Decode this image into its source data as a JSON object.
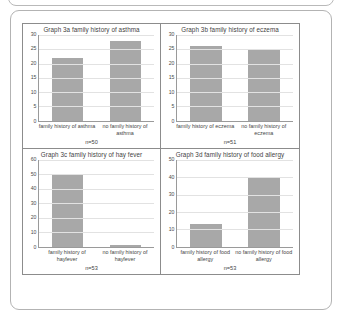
{
  "figure": {
    "panels": [
      {
        "title": "Graph 3a family history of asthma",
        "n_caption": "n=50",
        "chart_data": {
          "type": "bar",
          "title": "Graph 3a family history of asthma",
          "categories": [
            "family history of asthma",
            "no family history of asthma"
          ],
          "values": [
            22,
            28
          ],
          "xlabel": "",
          "ylabel": "",
          "ylim": [
            0,
            30
          ],
          "yticks": [
            0,
            5,
            10,
            15,
            20,
            25,
            30
          ],
          "grid": true,
          "legend": "none",
          "bar_color": "#a8a8a8",
          "annotation": "n=50"
        }
      },
      {
        "title": "Graph 3b family history of eczema",
        "n_caption": "n=51",
        "chart_data": {
          "type": "bar",
          "title": "Graph 3b family history of eczema",
          "categories": [
            "family history of eczema",
            "no family history of eczema"
          ],
          "values": [
            26,
            25
          ],
          "xlabel": "",
          "ylabel": "",
          "ylim": [
            0,
            30
          ],
          "yticks": [
            0,
            5,
            10,
            15,
            20,
            25,
            30
          ],
          "grid": true,
          "legend": "none",
          "bar_color": "#a8a8a8",
          "annotation": "n=51"
        }
      },
      {
        "title": "Graph 3c family history of hay fever",
        "n_caption": "n=53",
        "chart_data": {
          "type": "bar",
          "title": "Graph 3c family history of hay fever",
          "categories": [
            "family history of hayfever",
            "no family history of hayfever"
          ],
          "values": [
            50,
            1
          ],
          "xlabel": "",
          "ylabel": "",
          "ylim": [
            0,
            60
          ],
          "yticks": [
            0,
            10,
            20,
            30,
            40,
            50,
            60
          ],
          "grid": true,
          "legend": "none",
          "bar_color": "#a8a8a8",
          "annotation": "n=53"
        }
      },
      {
        "title": "Graph 3d family history of food allergy",
        "n_caption": "n=53",
        "chart_data": {
          "type": "bar",
          "title": "Graph 3d family history of food allergy",
          "categories": [
            "family history of food allergy",
            "no family history of food allergy"
          ],
          "values": [
            13,
            40
          ],
          "xlabel": "",
          "ylabel": "",
          "ylim": [
            0,
            50
          ],
          "yticks": [
            0,
            10,
            20,
            30,
            40,
            50
          ],
          "grid": true,
          "legend": "none",
          "bar_color": "#a8a8a8",
          "annotation": "n=53"
        }
      }
    ]
  },
  "chart_data": [
    {
      "type": "bar",
      "title": "Graph 3a family history of asthma",
      "categories": [
        "family history of asthma",
        "no family history of asthma"
      ],
      "values": [
        22,
        28
      ],
      "xlabel": "",
      "ylabel": "",
      "ylim": [
        0,
        30
      ],
      "yticks": [
        0,
        5,
        10,
        15,
        20,
        25,
        30
      ],
      "grid": true,
      "legend": "none",
      "annotation": "n=50"
    },
    {
      "type": "bar",
      "title": "Graph 3b family history of eczema",
      "categories": [
        "family history of eczema",
        "no family history of eczema"
      ],
      "values": [
        26,
        25
      ],
      "xlabel": "",
      "ylabel": "",
      "ylim": [
        0,
        30
      ],
      "yticks": [
        0,
        5,
        10,
        15,
        20,
        25,
        30
      ],
      "grid": true,
      "legend": "none",
      "annotation": "n=51"
    },
    {
      "type": "bar",
      "title": "Graph 3c family history of hay fever",
      "categories": [
        "family history of hayfever",
        "no family history of hayfever"
      ],
      "values": [
        50,
        1
      ],
      "xlabel": "",
      "ylabel": "",
      "ylim": [
        0,
        60
      ],
      "yticks": [
        0,
        10,
        20,
        30,
        40,
        50,
        60
      ],
      "grid": true,
      "legend": "none",
      "annotation": "n=53"
    },
    {
      "type": "bar",
      "title": "Graph 3d family history of food allergy",
      "categories": [
        "family history of food allergy",
        "no family history of food allergy"
      ],
      "values": [
        13,
        40
      ],
      "xlabel": "",
      "ylabel": "",
      "ylim": [
        0,
        50
      ],
      "yticks": [
        0,
        10,
        20,
        30,
        40,
        50
      ],
      "grid": true,
      "legend": "none",
      "annotation": "n=53"
    }
  ]
}
